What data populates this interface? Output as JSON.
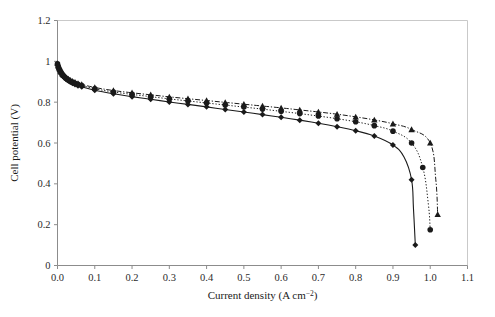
{
  "chart_data": {
    "type": "line",
    "title": "",
    "subtitle": "",
    "xlabel": "Current density (A cm",
    "xlabel_sup": "−2",
    "xlabel_tail": ")",
    "xlabel_full": "Current density (A cm−2)",
    "ylabel": "Cell potential (V)",
    "xlim": [
      0.0,
      1.1
    ],
    "ylim": [
      0.0,
      1.2
    ],
    "grid": false,
    "legend": "none",
    "xticks": [
      "0.0",
      "0.1",
      "0.2",
      "0.3",
      "0.4",
      "0.5",
      "0.6",
      "0.7",
      "0.8",
      "0.9",
      "1.0",
      "1.1"
    ],
    "xtick_values": [
      0.0,
      0.1,
      0.2,
      0.3,
      0.4,
      0.5,
      0.6,
      0.7,
      0.8,
      0.9,
      1.0,
      1.1
    ],
    "yticks": [
      "0",
      "0.2",
      "0.4",
      "0.6",
      "0.8",
      "1",
      "1.2"
    ],
    "ytick_values": [
      0.0,
      0.2,
      0.4,
      0.6,
      0.8,
      1.0,
      1.2
    ],
    "series": [
      {
        "name": "series-diamond",
        "marker": "diamond",
        "linestyle": "solid",
        "color": "#1a1a1a",
        "x": [
          0.0,
          0.002,
          0.004,
          0.006,
          0.008,
          0.01,
          0.013,
          0.016,
          0.02,
          0.024,
          0.029,
          0.034,
          0.04,
          0.047,
          0.055,
          0.065,
          0.1,
          0.15,
          0.2,
          0.25,
          0.3,
          0.35,
          0.4,
          0.45,
          0.5,
          0.55,
          0.6,
          0.65,
          0.7,
          0.75,
          0.8,
          0.85,
          0.9,
          0.93,
          0.95,
          0.955,
          0.96
        ],
        "y": [
          0.985,
          0.972,
          0.962,
          0.953,
          0.946,
          0.94,
          0.932,
          0.925,
          0.918,
          0.911,
          0.905,
          0.899,
          0.893,
          0.887,
          0.881,
          0.875,
          0.858,
          0.841,
          0.827,
          0.814,
          0.801,
          0.789,
          0.777,
          0.764,
          0.752,
          0.739,
          0.726,
          0.712,
          0.697,
          0.68,
          0.66,
          0.634,
          0.59,
          0.53,
          0.42,
          0.28,
          0.1
        ]
      },
      {
        "name": "series-circle",
        "marker": "circle",
        "linestyle": "dotted",
        "color": "#1a1a1a",
        "x": [
          0.0,
          0.002,
          0.004,
          0.006,
          0.008,
          0.01,
          0.013,
          0.016,
          0.02,
          0.024,
          0.029,
          0.034,
          0.04,
          0.047,
          0.055,
          0.065,
          0.1,
          0.15,
          0.2,
          0.25,
          0.3,
          0.35,
          0.4,
          0.45,
          0.5,
          0.55,
          0.6,
          0.65,
          0.7,
          0.75,
          0.8,
          0.85,
          0.9,
          0.95,
          0.98,
          0.995,
          1.0
        ],
        "y": [
          0.988,
          0.975,
          0.965,
          0.957,
          0.95,
          0.944,
          0.936,
          0.929,
          0.922,
          0.916,
          0.91,
          0.904,
          0.898,
          0.893,
          0.887,
          0.882,
          0.866,
          0.85,
          0.838,
          0.827,
          0.816,
          0.806,
          0.796,
          0.786,
          0.776,
          0.766,
          0.755,
          0.744,
          0.732,
          0.719,
          0.704,
          0.685,
          0.658,
          0.6,
          0.48,
          0.3,
          0.175
        ]
      },
      {
        "name": "series-triangle",
        "marker": "triangle",
        "linestyle": "dashdot",
        "color": "#1a1a1a",
        "x": [
          0.0,
          0.002,
          0.004,
          0.006,
          0.008,
          0.01,
          0.013,
          0.016,
          0.02,
          0.024,
          0.029,
          0.034,
          0.04,
          0.047,
          0.055,
          0.065,
          0.1,
          0.15,
          0.2,
          0.25,
          0.3,
          0.35,
          0.4,
          0.45,
          0.5,
          0.55,
          0.6,
          0.65,
          0.7,
          0.75,
          0.8,
          0.85,
          0.9,
          0.95,
          1.0,
          1.015,
          1.02
        ],
        "y": [
          0.99,
          0.978,
          0.968,
          0.96,
          0.953,
          0.947,
          0.939,
          0.932,
          0.926,
          0.92,
          0.914,
          0.908,
          0.903,
          0.898,
          0.892,
          0.887,
          0.872,
          0.857,
          0.846,
          0.836,
          0.826,
          0.817,
          0.808,
          0.799,
          0.79,
          0.781,
          0.772,
          0.762,
          0.752,
          0.741,
          0.728,
          0.713,
          0.694,
          0.666,
          0.6,
          0.42,
          0.25
        ]
      }
    ]
  },
  "colors": {
    "axis": "#8c8c8c",
    "frame": "#c9c9c9",
    "data": "#1a1a1a",
    "text": "#1a1a1a",
    "background": "#ffffff"
  }
}
